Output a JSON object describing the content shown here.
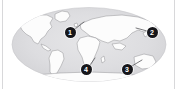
{
  "widget": {
    "name": "world-map-thumbnail",
    "title": "World map with numbered location markers",
    "projection": "elliptical"
  },
  "colors": {
    "page_background": "#ffffff",
    "frame_border": "#d8d8da",
    "ocean_fill": "#d9d9db",
    "ocean_fill_light": "#e4e4e6",
    "land_fill": "#fcfcfc",
    "land_stroke": "#9a9a9e",
    "marker_fill": "#16161a",
    "marker_text": "#ffffff",
    "leader_line": "#58585c"
  },
  "map": {
    "ellipse": {
      "cx": 89,
      "cy": 44.5,
      "rx": 77,
      "ry": 37
    },
    "landmasses": [
      {
        "name": "north-america"
      },
      {
        "name": "south-america"
      },
      {
        "name": "greenland"
      },
      {
        "name": "europe"
      },
      {
        "name": "africa"
      },
      {
        "name": "asia"
      },
      {
        "name": "australia"
      },
      {
        "name": "antarctica"
      },
      {
        "name": "japan"
      },
      {
        "name": "madagascar"
      },
      {
        "name": "new-zealand"
      },
      {
        "name": "british-isles"
      }
    ]
  },
  "markers": [
    {
      "id": "marker-1",
      "label": "1",
      "x": 70,
      "y": 32,
      "leader": {
        "x1": 75,
        "y1": 29,
        "x2": 84,
        "y2": 22
      }
    },
    {
      "id": "marker-2",
      "label": "2",
      "x": 152,
      "y": 32,
      "leader": {
        "x1": 147,
        "y1": 31,
        "x2": 136,
        "y2": 28
      }
    },
    {
      "id": "marker-3",
      "label": "3",
      "x": 127,
      "y": 69,
      "leader": {
        "x1": 132,
        "y1": 66,
        "x2": 142,
        "y2": 60
      }
    },
    {
      "id": "marker-4",
      "label": "4",
      "x": 86,
      "y": 69,
      "leader": {
        "x1": 90,
        "y1": 65,
        "x2": 95,
        "y2": 58
      }
    }
  ]
}
